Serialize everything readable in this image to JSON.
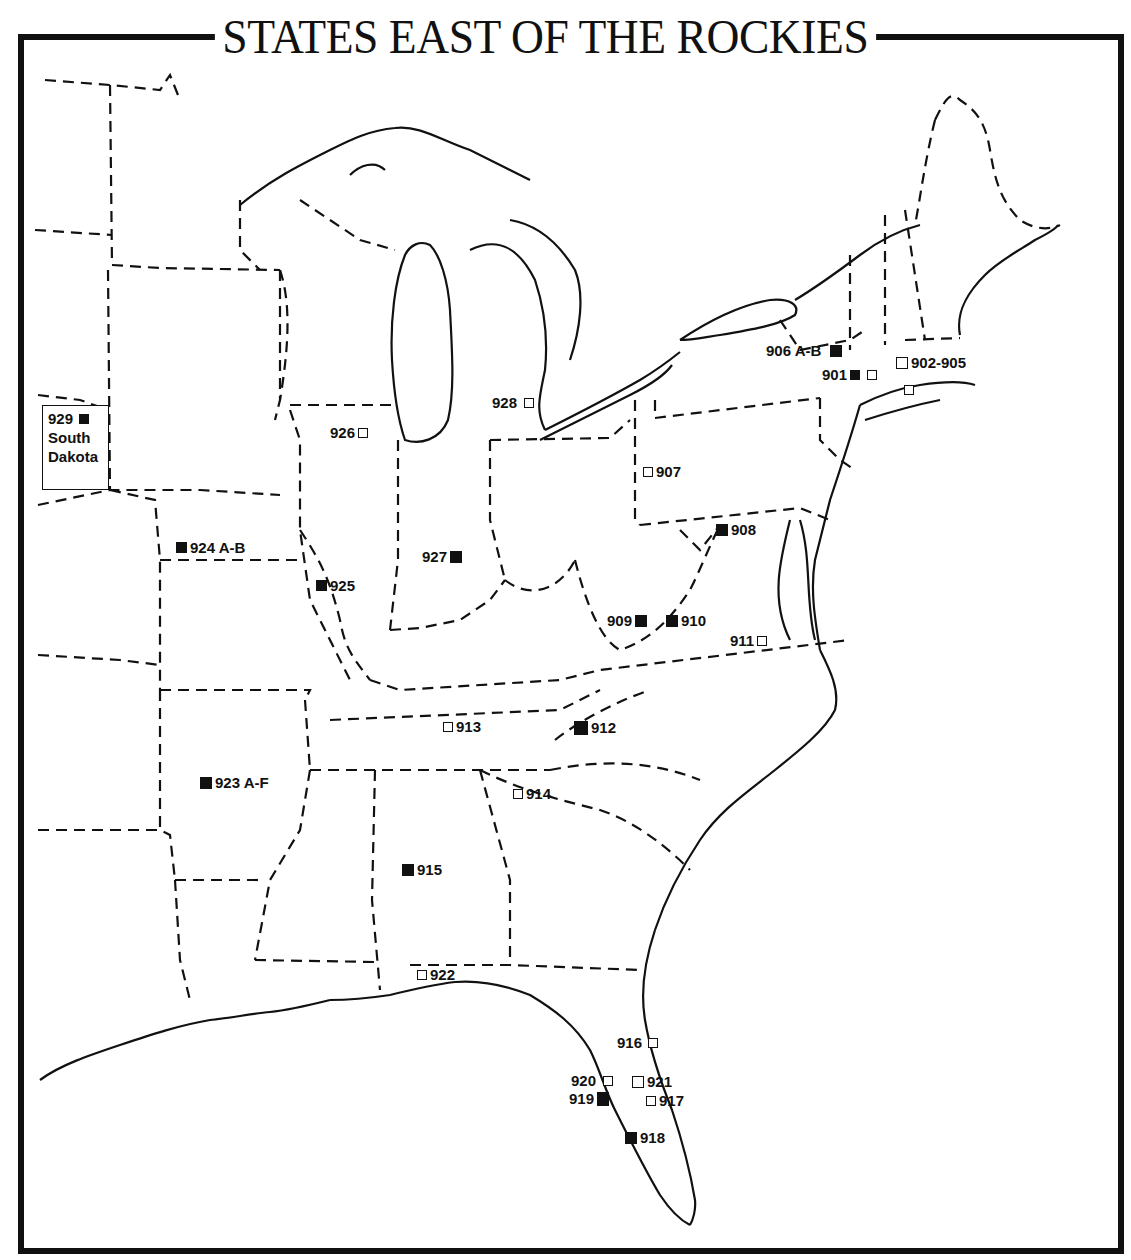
{
  "title": "STATES EAST OF THE ROCKIES",
  "inset": {
    "number": "929",
    "line1": "South",
    "line2": "Dakota",
    "filled": true
  },
  "legend_semantics": {
    "filled_square": "filled marker",
    "hollow_square": "hollow marker"
  },
  "markers": [
    {
      "label": "901",
      "filled": true
    },
    {
      "label": "902-905",
      "filled": false
    },
    {
      "label": "906 A-B",
      "filled": true
    },
    {
      "label": "907",
      "filled": false
    },
    {
      "label": "908",
      "filled": true
    },
    {
      "label": "909",
      "filled": true
    },
    {
      "label": "910",
      "filled": true
    },
    {
      "label": "911",
      "filled": false
    },
    {
      "label": "912",
      "filled": true
    },
    {
      "label": "913",
      "filled": false
    },
    {
      "label": "914",
      "filled": false
    },
    {
      "label": "915",
      "filled": true
    },
    {
      "label": "916",
      "filled": false
    },
    {
      "label": "917",
      "filled": false
    },
    {
      "label": "918",
      "filled": true
    },
    {
      "label": "919",
      "filled": true
    },
    {
      "label": "920",
      "filled": false
    },
    {
      "label": "921",
      "filled": false
    },
    {
      "label": "922",
      "filled": false
    },
    {
      "label": "923 A-F",
      "filled": true
    },
    {
      "label": "924 A-B",
      "filled": true
    },
    {
      "label": "925",
      "filled": true
    },
    {
      "label": "926",
      "filled": false
    },
    {
      "label": "927",
      "filled": true
    },
    {
      "label": "928",
      "filled": false
    }
  ]
}
